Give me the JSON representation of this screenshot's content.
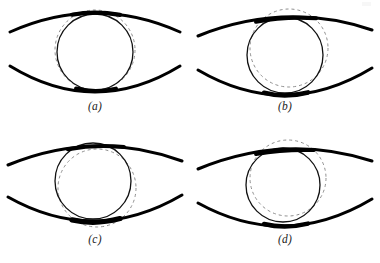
{
  "figure": {
    "background_color": "#ffffff",
    "ink_color": "#000000",
    "dashed_color": "#8a8a8a",
    "panel_count": 4,
    "layout": "2x2 grid"
  },
  "panels": [
    {
      "id": "a",
      "caption": "(a)",
      "solid_circle": {
        "cx": 95,
        "cy": 52,
        "r": 38,
        "stroke_width": 1.3
      },
      "dashed_circle": {
        "cx": 95,
        "cy": 50,
        "r": 40,
        "stroke_width": 1.0,
        "dash": "3 3"
      },
      "upper_arc": {
        "start_x": 10,
        "start_y": 32,
        "end_x": 180,
        "end_y": 32,
        "peak_y": 13,
        "stroke_width": 3.0
      },
      "lower_arc": {
        "start_x": 10,
        "start_y": 66,
        "end_x": 180,
        "end_y": 66,
        "trough_y": 92,
        "stroke_width": 3.0
      },
      "dashed_offset": {
        "dx": 0,
        "dy": -2
      },
      "note": "dashed circle nearly concentric, slightly larger and raised"
    },
    {
      "id": "b",
      "caption": "(b)",
      "solid_circle": {
        "cx": 95,
        "cy": 55,
        "r": 38,
        "stroke_width": 1.3
      },
      "dashed_circle": {
        "cx": 99,
        "cy": 48,
        "r": 39,
        "stroke_width": 1.0,
        "dash": "3 3"
      },
      "upper_arc": {
        "start_x": 8,
        "start_y": 36,
        "end_x": 182,
        "end_y": 30,
        "peak_y": 17,
        "stroke_width": 3.0
      },
      "lower_arc": {
        "start_x": 8,
        "start_y": 70,
        "end_x": 182,
        "end_y": 68,
        "trough_y": 95,
        "stroke_width": 3.0
      },
      "dashed_offset": {
        "dx": 4,
        "dy": -7
      },
      "note": "dashed circle shifted up and to the right"
    },
    {
      "id": "c",
      "caption": "(c)",
      "solid_circle": {
        "cx": 93,
        "cy": 50,
        "r": 38,
        "stroke_width": 1.3
      },
      "dashed_circle": {
        "cx": 97,
        "cy": 57,
        "r": 39,
        "stroke_width": 1.0,
        "dash": "3 3"
      },
      "upper_arc": {
        "start_x": 8,
        "start_y": 34,
        "end_x": 182,
        "end_y": 30,
        "peak_y": 15,
        "stroke_width": 3.0
      },
      "lower_arc": {
        "start_x": 8,
        "start_y": 66,
        "end_x": 182,
        "end_y": 64,
        "trough_y": 90,
        "stroke_width": 3.0
      },
      "dashed_offset": {
        "dx": 4,
        "dy": 7
      },
      "note": "dashed circle shifted down and slightly right"
    },
    {
      "id": "d",
      "caption": "(d)",
      "solid_circle": {
        "cx": 93,
        "cy": 54,
        "r": 37,
        "stroke_width": 1.3
      },
      "dashed_circle": {
        "cx": 98,
        "cy": 47,
        "r": 38,
        "stroke_width": 1.0,
        "dash": "3 3"
      },
      "upper_arc": {
        "start_x": 8,
        "start_y": 38,
        "end_x": 182,
        "end_y": 30,
        "peak_y": 18,
        "stroke_width": 3.0
      },
      "lower_arc": {
        "start_x": 8,
        "start_y": 72,
        "end_x": 182,
        "end_y": 68,
        "trough_y": 95,
        "stroke_width": 3.0
      },
      "dashed_offset": {
        "dx": 5,
        "dy": -7
      },
      "note": "dashed circle shifted up and to the right"
    }
  ]
}
